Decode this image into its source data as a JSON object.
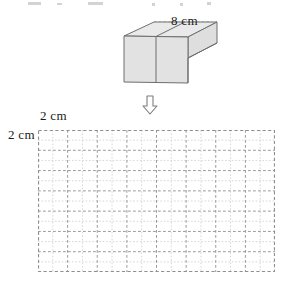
{
  "figure": {
    "solid": {
      "name": "two-cube-rectangular-prism",
      "cube_count": 2,
      "dimension_label": "8 cm",
      "face_colors": {
        "top": "#e9e9e9",
        "front": "#e0e0e0",
        "side": "#d2d2d2",
        "outline": "#6e6e6e"
      }
    },
    "transition_arrow": {
      "icon": "arrow-down-outline-icon",
      "direction": "down"
    },
    "net_grid": {
      "label_top": "2 cm",
      "label_left": "2 cm",
      "major_columns": 8,
      "major_rows": 7,
      "minor_subdivisions_per_cell": 2,
      "border_style": "dashed",
      "major_line_color": "#9a9a9a",
      "minor_line_color": "#cdcdcd"
    }
  },
  "colors": {
    "ink": "#1a1a1a",
    "page_background": "#ffffff"
  }
}
